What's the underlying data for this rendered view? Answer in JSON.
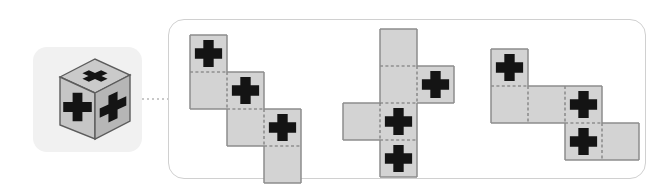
{
  "figure": {
    "type": "geometry-net-puzzle",
    "symbol_name": "plus-cross-glyph",
    "face_symbol_count": 3
  },
  "colors": {
    "face_fill": "#d3d3d3",
    "face_fill_light": "#dcdcdc",
    "face_stroke": "#8c8c8c",
    "fold_line": "#6e6e6e",
    "symbol": "#141414",
    "thumb_background": "#f1f1f1",
    "panel_border": "#d0d0d0",
    "connector": "#c8c8c8",
    "cube_top": "#c9c9c9",
    "cube_front": "#c4c4c4",
    "cube_side": "#b5b5b5",
    "page_background": "#ffffff"
  },
  "thumbnail": {
    "name": "cube-thumbnail",
    "shape": "cube",
    "visible_faces": [
      "top",
      "front-left",
      "right"
    ],
    "symbol_on_each_visible_face": true,
    "x": 33,
    "y": 47,
    "width": 109,
    "height": 105,
    "corner_radius": 14
  },
  "connector": {
    "name": "dotted-connector",
    "style": "dotted",
    "from_x": 142,
    "to_x": 169,
    "y": 99
  },
  "panel": {
    "name": "nets-panel",
    "x": 168,
    "y": 19,
    "width": 478,
    "height": 160,
    "corner_radius": 16
  },
  "cell_size": 37,
  "nets": [
    {
      "id": "net-1",
      "name": "net-staircase-descending",
      "label": "Net 1",
      "origin_x": 188,
      "origin_y": 33,
      "grid_cols": 4,
      "grid_rows": 4,
      "cells": [
        {
          "col": 0,
          "row": 0,
          "symbol": true
        },
        {
          "col": 0,
          "row": 1,
          "symbol": false
        },
        {
          "col": 1,
          "row": 1,
          "symbol": true
        },
        {
          "col": 1,
          "row": 2,
          "symbol": false
        },
        {
          "col": 2,
          "row": 2,
          "symbol": true
        },
        {
          "col": 2,
          "row": 3,
          "symbol": false
        }
      ],
      "symbol_count": 3
    },
    {
      "id": "net-2",
      "name": "net-cross-column",
      "label": "Net 2",
      "origin_x": 341,
      "origin_y": 27,
      "grid_cols": 3,
      "grid_rows": 4,
      "cells": [
        {
          "col": 1,
          "row": 0,
          "symbol": false
        },
        {
          "col": 1,
          "row": 1,
          "symbol": false
        },
        {
          "col": 2,
          "row": 1,
          "symbol": true
        },
        {
          "col": 0,
          "row": 2,
          "symbol": false
        },
        {
          "col": 1,
          "row": 2,
          "symbol": true
        },
        {
          "col": 1,
          "row": 3,
          "symbol": true
        }
      ],
      "symbol_count": 3
    },
    {
      "id": "net-3",
      "name": "net-zigzag-step",
      "label": "Net 3",
      "origin_x": 489,
      "origin_y": 47,
      "grid_cols": 4,
      "grid_rows": 3,
      "cells": [
        {
          "col": 0,
          "row": 0,
          "symbol": true
        },
        {
          "col": 0,
          "row": 1,
          "symbol": false
        },
        {
          "col": 1,
          "row": 1,
          "symbol": false
        },
        {
          "col": 2,
          "row": 1,
          "symbol": true
        },
        {
          "col": 2,
          "row": 2,
          "symbol": true
        },
        {
          "col": 3,
          "row": 2,
          "symbol": false
        }
      ],
      "symbol_count": 3
    }
  ]
}
